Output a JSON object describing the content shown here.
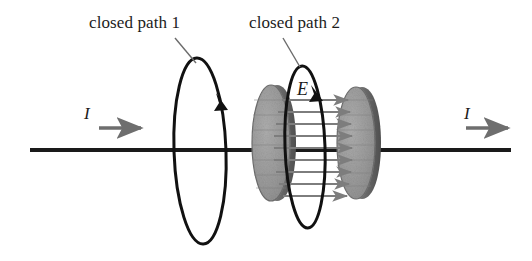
{
  "figure": {
    "width": 532,
    "height": 261,
    "background_color": "#ffffff"
  },
  "labels": {
    "closed_path_1": "closed path 1",
    "closed_path_2": "closed path 2",
    "current_left": "I",
    "current_right": "I",
    "electric_field": "E"
  },
  "colors": {
    "stroke_dark": "#111111",
    "wire": "#1a1a1a",
    "plate_fill": "#9a9a9a",
    "plate_edge": "#5a5a5a",
    "plate_rim": "#6b6b6b",
    "field_arrow": "#7d7d7d",
    "current_arrow": "#6e6e6e",
    "leader_line": "#6b6b6b",
    "text": "#1c1c1c"
  },
  "geometry": {
    "wire": {
      "x1": 30,
      "y1": 150,
      "x2": 511,
      "y2": 150,
      "thickness": 4
    },
    "loop1": {
      "cx": 200,
      "cy": 151,
      "rx": 26,
      "ry": 93,
      "rotation": -2
    },
    "loop2": {
      "cx": 305,
      "cy": 147,
      "rx": 20,
      "ry": 81,
      "rotation": -2
    },
    "plate_left": {
      "cx": 271,
      "cy": 143,
      "rx": 19,
      "ry": 58
    },
    "plate_right": {
      "cx": 356,
      "cy": 143,
      "rx": 19,
      "ry": 56
    },
    "field_arrows_count": 9,
    "field_arrow_x_start": 288,
    "field_arrow_x_end": 352,
    "current_arrow_left": {
      "x1": 99,
      "y1": 128,
      "x2": 145,
      "y2": 128
    },
    "current_arrow_right": {
      "x1": 466,
      "y1": 128,
      "x2": 512,
      "y2": 128
    },
    "leader_line_1": {
      "x1": 175,
      "y1": 38,
      "x2": 196,
      "y2": 62
    },
    "leader_line_2": {
      "x1": 283,
      "y1": 38,
      "x2": 300,
      "y2": 66
    }
  },
  "field_arrows": [
    {
      "y": 100
    },
    {
      "y": 112
    },
    {
      "y": 124
    },
    {
      "y": 136
    },
    {
      "y": 148
    },
    {
      "y": 160
    },
    {
      "y": 172
    },
    {
      "y": 184
    },
    {
      "y": 196
    }
  ],
  "plate_ribs_left": [
    95,
    110,
    125,
    140,
    155,
    170,
    185
  ],
  "plate_ribs_right": [
    95,
    110,
    125,
    140,
    155,
    170,
    185
  ]
}
